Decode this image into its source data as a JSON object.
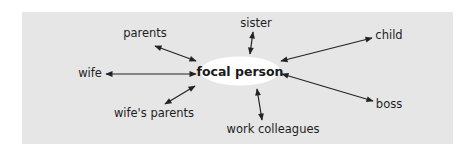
{
  "diagram": {
    "type": "network",
    "center": {
      "label": "focal person",
      "x": 240,
      "y": 71
    },
    "colors": {
      "panel_bg": "#e6e6e6",
      "ellipse": "#ffffff",
      "arrow": "#222222",
      "text": "#1e1e1e"
    },
    "nodes": [
      {
        "id": "parents",
        "label": "parents",
        "x": 145,
        "y": 34
      },
      {
        "id": "wife",
        "label": "wife",
        "x": 90,
        "y": 74
      },
      {
        "id": "wifes-parents",
        "label": "wife's parents",
        "x": 154,
        "y": 114
      },
      {
        "id": "sister",
        "label": "sister",
        "x": 256,
        "y": 24
      },
      {
        "id": "work-colleagues",
        "label": "work colleagues",
        "x": 273,
        "y": 130
      },
      {
        "id": "child",
        "label": "child",
        "x": 389,
        "y": 36
      },
      {
        "id": "boss",
        "label": "boss",
        "x": 389,
        "y": 105
      }
    ],
    "edges": [
      {
        "to": "parents",
        "x1": 196,
        "y1": 61,
        "x2": 155,
        "y2": 46,
        "bidirectional": true
      },
      {
        "to": "wife",
        "x1": 196,
        "y1": 74,
        "x2": 106,
        "y2": 74,
        "bidirectional": true
      },
      {
        "to": "wifes-parents",
        "x1": 195,
        "y1": 86,
        "x2": 165,
        "y2": 104,
        "bidirectional": true
      },
      {
        "to": "sister",
        "x1": 250,
        "y1": 54,
        "x2": 253,
        "y2": 32,
        "bidirectional": true
      },
      {
        "to": "work-colleagues",
        "x1": 257,
        "y1": 89,
        "x2": 262,
        "y2": 120,
        "bidirectional": true
      },
      {
        "to": "child",
        "x1": 281,
        "y1": 61,
        "x2": 372,
        "y2": 38,
        "bidirectional": true
      },
      {
        "to": "boss",
        "x1": 282,
        "y1": 74,
        "x2": 373,
        "y2": 101,
        "bidirectional": true
      }
    ]
  }
}
